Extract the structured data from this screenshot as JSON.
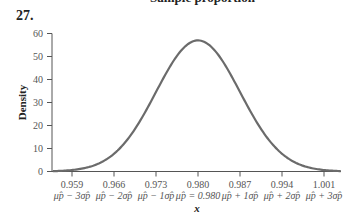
{
  "header": {
    "cut_title": "Sample proportion",
    "problem_number": "27."
  },
  "chart_data": {
    "type": "line",
    "title": "",
    "xlabel": "x",
    "ylabel": "Density",
    "ylim": [
      0,
      60
    ],
    "yticks": [
      0,
      10,
      20,
      30,
      40,
      50,
      60
    ],
    "xticks": [
      0.959,
      0.966,
      0.973,
      0.98,
      0.987,
      0.994,
      1.001
    ],
    "xtick_labels": [
      "0.959",
      "0.966",
      "0.973",
      "0.980",
      "0.987",
      "0.994",
      "1.001"
    ],
    "xtick_sublabels": [
      "μp̂ − 3σp̂",
      "μp̂ − 2σp̂",
      "μp̂ − 1σp̂",
      "μp̂ = 0.980",
      "μp̂ + 1σp̂",
      "μp̂ + 2σp̂",
      "μp̂ + 3σp̂"
    ],
    "distribution": {
      "name": "normal",
      "mean": 0.98,
      "sd": 0.007
    },
    "peak_density": 57,
    "grid": false,
    "curve_color": "#6b6b6b"
  }
}
